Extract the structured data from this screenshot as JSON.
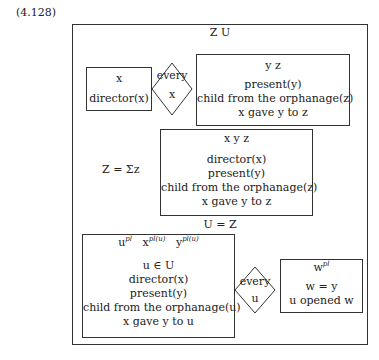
{
  "label": "(4.128)",
  "outer": {
    "referents": "Z  U"
  },
  "top_left": {
    "referents": "x",
    "conditions": [
      "director(x)"
    ]
  },
  "quantifier_top": {
    "word": "every",
    "var": "x"
  },
  "top_right": {
    "referents": "y  z",
    "conditions": [
      "present(y)",
      "child from the orphanage(z)",
      "x gave y to z"
    ]
  },
  "sigma": {
    "prefix": "Z = Σz"
  },
  "middle": {
    "referents": "x  y  z",
    "conditions": [
      "director(x)",
      "present(y)",
      "child from the orphanage(z)",
      "x gave y to z"
    ]
  },
  "equation": "U = Z",
  "bottom_left": {
    "referents": [
      {
        "v": "u",
        "sup": "pl"
      },
      {
        "v": "x",
        "sup": "pl(u)"
      },
      {
        "v": "y",
        "sup": "pl(u)"
      }
    ],
    "conditions": [
      "u ∈ U",
      "director(x)",
      "present(y)",
      "child from the orphanage(u)",
      "x gave y to u"
    ]
  },
  "quantifier_bottom": {
    "word": "every",
    "var": "u"
  },
  "bottom_right": {
    "referents": [
      {
        "v": "w",
        "sup": "pl"
      }
    ],
    "conditions": [
      "w = y",
      "u opened w"
    ]
  }
}
